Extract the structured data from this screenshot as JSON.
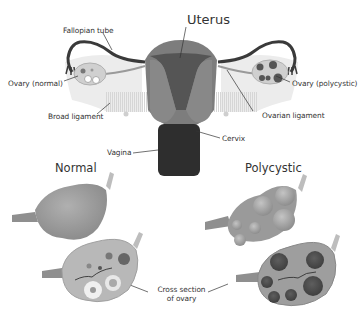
{
  "title_partial": "",
  "anatomy": {
    "labels": {
      "uterus": "Uterus",
      "fallopian_tube": "Fallopian tube",
      "ovary_normal": "Ovary (normal)",
      "ovary_polycystic": "Ovary (polycystic)",
      "broad_ligament": "Broad ligament",
      "ovarian_ligament": "Ovarian ligament",
      "cervix": "Cervix",
      "vagina": "Vagina"
    }
  },
  "comparison": {
    "normal_heading": "Normal",
    "polycystic_heading": "Polycystic",
    "cross_section_line1": "Cross section",
    "cross_section_line2": "of ovary"
  },
  "colors": {
    "tube": "#3a3a3a",
    "uterus_outer": "#7d7d7d",
    "uterus_inner": "#555555",
    "vagina": "#2e2e2e",
    "ovary": "#9a9a9a",
    "ligament": "#e8e8e8",
    "cyst": "#6e6e6e",
    "label": "#333333"
  }
}
